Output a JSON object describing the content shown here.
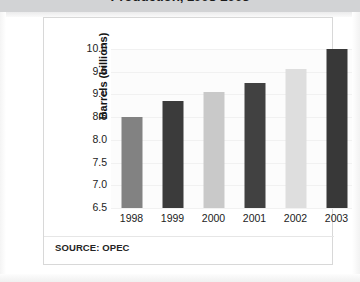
{
  "title_band": {
    "title": "Production, 1998-2003",
    "band_color": "#d2d3d5"
  },
  "footer": {
    "source_note": "SOURCE: OPEC"
  },
  "chart_data": {
    "type": "bar",
    "title": "Production, 1998-2003",
    "xlabel": "",
    "ylabel": "Barrels (billions)",
    "categories": [
      "1998",
      "1999",
      "2000",
      "2001",
      "2002",
      "2003"
    ],
    "values": [
      8.5,
      8.85,
      9.05,
      9.25,
      9.55,
      10.0
    ],
    "bar_colors": [
      "#828282",
      "#3b3b3b",
      "#c9c9c9",
      "#414141",
      "#dedede",
      "#383838"
    ],
    "ylim": [
      6.5,
      10.0
    ],
    "ytick_labels": [
      "10.0",
      "9.5",
      "9.0",
      "8.5",
      "8.0",
      "7.5",
      "7.0",
      "6.5"
    ],
    "ytick_values": [
      10.0,
      9.5,
      9.0,
      8.5,
      8.0,
      7.5,
      7.0,
      6.5
    ],
    "grid": true,
    "legend": "none",
    "plot_background": "#fcfcfc",
    "annotations": [
      "SOURCE: OPEC"
    ]
  }
}
